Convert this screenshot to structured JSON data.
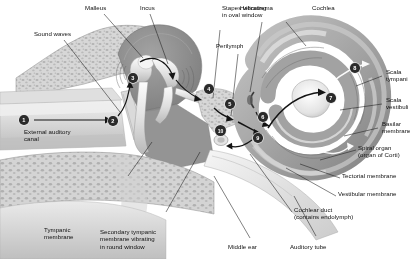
{
  "figure": {
    "type": "anatomical-diagram",
    "palette": {
      "background": "#ffffff",
      "text": "#101010",
      "leader_line": "#1a1a1a",
      "marker_fill": "#2b2b2b",
      "marker_text": "#ffffff",
      "bone_light": "#e4e0d8",
      "bone_mid": "#c9c4ba",
      "cavity_dark": "#8d8a85",
      "cochlea_mid": "#b4b0a8",
      "cochlea_dark": "#8a8780",
      "spongy_bone": "#d8d3c8"
    }
  },
  "labels": [
    {
      "id": "malleus",
      "text": "Malleus"
    },
    {
      "id": "incus",
      "text": "Incus"
    },
    {
      "id": "stapes",
      "text": "Stapes vibrating\nin oval window"
    },
    {
      "id": "helicotrema",
      "text": "Helicotrema"
    },
    {
      "id": "cochlea",
      "text": "Cochlea"
    },
    {
      "id": "perilymph",
      "text": "Perilymph"
    },
    {
      "id": "sound-waves",
      "text": "Sound waves"
    },
    {
      "id": "external-auditory",
      "text": "External auditory\ncanal"
    },
    {
      "id": "tympanic-membrane",
      "text": "Tympanic\nmembrane"
    },
    {
      "id": "secondary-tympanic",
      "text": "Secondary tympanic\nmembrane vibrating\nin round window"
    },
    {
      "id": "middle-ear",
      "text": "Middle ear"
    },
    {
      "id": "auditory-tube",
      "text": "Auditory tube"
    },
    {
      "id": "scala-tympani",
      "text": "Scala\ntympani"
    },
    {
      "id": "scala-vestibuli",
      "text": "Scala\nvestibuli"
    },
    {
      "id": "basilar-membrane",
      "text": "Basilar\nmembrane"
    },
    {
      "id": "spiral-organ",
      "text": "Spiral organ\n(organ of Corti)"
    },
    {
      "id": "tectorial-membrane",
      "text": "Tectorial membrane"
    },
    {
      "id": "vestibular-membrane",
      "text": "Vestibular membrane"
    },
    {
      "id": "cochlear-duct",
      "text": "Cochlear duct\n(contains endolymph)"
    }
  ],
  "markers": [
    {
      "n": "1",
      "meaning": "sound waves enter external auditory canal"
    },
    {
      "n": "2",
      "meaning": "tympanic membrane vibrates"
    },
    {
      "n": "3",
      "meaning": "auditory ossicles vibrate"
    },
    {
      "n": "4",
      "meaning": "stapes vibrates in oval window"
    },
    {
      "n": "5",
      "meaning": "perilymph of scala vestibuli set in motion"
    },
    {
      "n": "6",
      "meaning": "vibration travels along scala vestibuli"
    },
    {
      "n": "7",
      "meaning": "pressure wave passes helicotrema region"
    },
    {
      "n": "8",
      "meaning": "wave returns through scala tympani"
    },
    {
      "n": "9",
      "meaning": "basilar membrane displacement"
    },
    {
      "n": "10",
      "meaning": "secondary tympanic membrane bulges at round window"
    }
  ]
}
